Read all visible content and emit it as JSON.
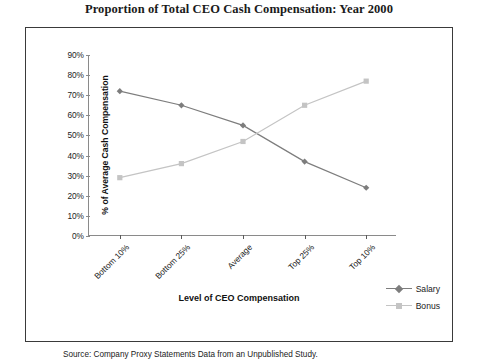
{
  "title": "Proportion of Total CEO Cash Compensation: Year 2000",
  "source_note": "Source: Company Proxy Statements Data from an Unpublished Study.",
  "legend": {
    "position": "right-bottom",
    "entries": [
      {
        "label": "Salary",
        "color": "#7d7d7d",
        "marker": "diamond"
      },
      {
        "label": "Bonus",
        "color": "#c4c4c4",
        "marker": "square"
      }
    ]
  },
  "chart_data": {
    "type": "line",
    "title": "Proportion of Total CEO Cash Compensation: Year 2000",
    "xlabel": "Level of CEO Compensation",
    "ylabel": "% of Average Cash Compensation",
    "categories": [
      "Bottom 10%",
      "Bottom 25%",
      "Average",
      "Top 25%",
      "Top 10%"
    ],
    "ylim": [
      0,
      90
    ],
    "ytick_step": 10,
    "yticks": [
      "90%",
      "80%",
      "70%",
      "60%",
      "50%",
      "40%",
      "30%",
      "20%",
      "10%",
      "0%"
    ],
    "grid": false,
    "series": [
      {
        "name": "Salary",
        "color": "#7d7d7d",
        "marker": "diamond",
        "values": [
          72,
          65,
          55,
          37,
          24
        ]
      },
      {
        "name": "Bonus",
        "color": "#c4c4c4",
        "marker": "square",
        "values": [
          29,
          36,
          47,
          65,
          77
        ]
      }
    ]
  }
}
